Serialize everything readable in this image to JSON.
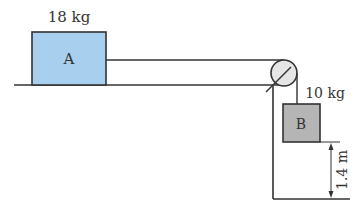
{
  "diagram": {
    "block_a": {
      "label": "A",
      "mass_label": "18 kg",
      "fill": "#a9cfee"
    },
    "block_b": {
      "label": "B",
      "mass_label": "10 kg",
      "fill": "#b5b5b5"
    },
    "height_label": "1.4 m",
    "line_color": "#333333",
    "pulley_fill": "#e6e6e6"
  }
}
